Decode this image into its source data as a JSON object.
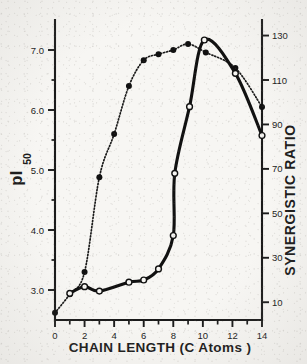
{
  "figure": {
    "background_color": "#f7f6f3",
    "ink_color": "#1a1a1a"
  },
  "chart_data": {
    "type": "line",
    "title": "",
    "xlabel": "CHAIN  LENGTH (C  Atoms )",
    "xlabel_parts": {
      "chain": "CHAIN",
      "length": "LENGTH",
      "paren_open": "(C",
      "atoms": "Atoms )"
    },
    "ylabel_left_main": "pI",
    "ylabel_left_sub": "50",
    "ylabel_right": "SYNERGISTIC  RATIO",
    "xlim": [
      0,
      14
    ],
    "xticks": [
      0,
      2,
      4,
      6,
      8,
      10,
      12,
      14
    ],
    "xticklabels": [
      "0",
      "2",
      "4",
      "6",
      "8",
      "10",
      "12",
      "14"
    ],
    "x_minor_ticks": [
      1,
      3,
      5,
      7,
      9,
      11,
      13
    ],
    "ylim_left": [
      2.5,
      7.5
    ],
    "yticks_left": [
      3.0,
      4.0,
      5.0,
      6.0,
      7.0
    ],
    "yticklabels_left": [
      "3.0",
      "4.0",
      "5.0",
      "6.0",
      "7.0"
    ],
    "y_minor_ticks_left": [
      3.5,
      4.5,
      5.5,
      6.5
    ],
    "ylim_right": [
      2,
      137
    ],
    "yticks_right": [
      10,
      30,
      50,
      70,
      90,
      110,
      130
    ],
    "yticklabels_right": [
      "10",
      "30",
      "50",
      "70",
      "90",
      "110",
      "130"
    ],
    "grid": false,
    "legend": "none",
    "series": [
      {
        "name": "pI50",
        "marker": "filled-circle",
        "linestyle": "dotted",
        "axis": "left",
        "points": [
          {
            "x": 0,
            "y": 2.62
          },
          {
            "x": 1,
            "y": 2.93
          },
          {
            "x": 2,
            "y": 3.3
          },
          {
            "x": 3,
            "y": 4.88
          },
          {
            "x": 4,
            "y": 5.6
          },
          {
            "x": 5,
            "y": 6.4
          },
          {
            "x": 6,
            "y": 6.83
          },
          {
            "x": 7,
            "y": 6.93
          },
          {
            "x": 8,
            "y": 7.0
          },
          {
            "x": 9,
            "y": 7.1
          },
          {
            "x": 10.2,
            "y": 6.96
          },
          {
            "x": 12.2,
            "y": 6.7
          },
          {
            "x": 14,
            "y": 6.05
          }
        ]
      },
      {
        "name": "Synergistic ratio",
        "marker": "open-circle",
        "linestyle": "solid",
        "axis": "right",
        "points": [
          {
            "x": 1,
            "y": 14
          },
          {
            "x": 2,
            "y": 17
          },
          {
            "x": 3,
            "y": 15
          },
          {
            "x": 5,
            "y": 19
          },
          {
            "x": 6,
            "y": 20
          },
          {
            "x": 7,
            "y": 25
          },
          {
            "x": 8,
            "y": 40
          },
          {
            "x": 8.1,
            "y": 68
          },
          {
            "x": 9.1,
            "y": 98
          },
          {
            "x": 10.1,
            "y": 128
          },
          {
            "x": 12.2,
            "y": 113
          },
          {
            "x": 14,
            "y": 85
          }
        ]
      }
    ]
  }
}
